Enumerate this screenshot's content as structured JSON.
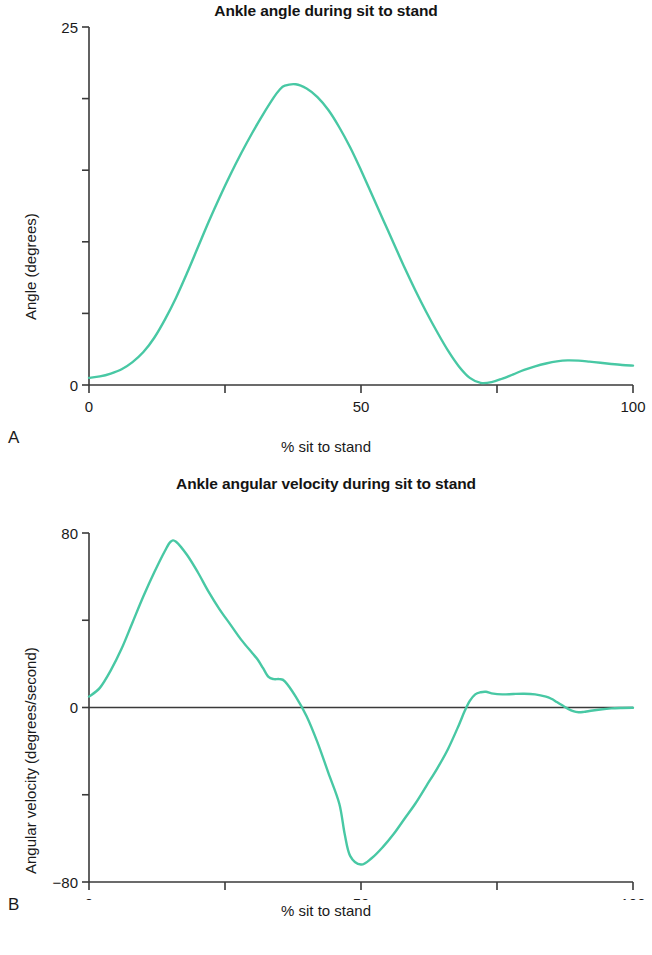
{
  "figure": {
    "background": "#ffffff",
    "line_color": "#48c8a4",
    "axis_color": "#3a3a3a",
    "text_color": "#1a1a1a"
  },
  "panels": [
    {
      "letter": "A",
      "title": "Ankle angle during sit to stand",
      "xlabel": "% sit to stand",
      "ylabel": "Angle (degrees)",
      "x_ticks": [
        0,
        25,
        50,
        75,
        100
      ],
      "x_tick_labels": [
        "0",
        "",
        "50",
        "",
        "100"
      ],
      "y_ticks": [
        0,
        5,
        10,
        15,
        20,
        25
      ],
      "y_tick_labels": [
        "0",
        "",
        "",
        "",
        "",
        "25"
      ]
    },
    {
      "letter": "B",
      "title": "Ankle angular velocity during sit to stand",
      "xlabel": "% sit to stand",
      "ylabel": "Angular velocity (degrees/second)",
      "x_ticks": [
        0,
        25,
        50,
        75,
        100
      ],
      "x_tick_labels": [
        "0",
        "",
        "50",
        "",
        "100"
      ],
      "y_ticks": [
        -80,
        -40,
        0,
        40,
        80
      ],
      "y_tick_labels": [
        "−80",
        "",
        "0",
        "",
        "80"
      ]
    }
  ],
  "chart_data": [
    {
      "type": "line",
      "title": "Ankle angle during sit to stand",
      "xlabel": "% sit to stand",
      "ylabel": "Angle (degrees)",
      "xlim": [
        0,
        100
      ],
      "ylim": [
        0,
        25
      ],
      "grid": false,
      "legend": "none",
      "series": [
        {
          "name": "Ankle angle",
          "color": "#48c8a4",
          "x": [
            0,
            2,
            4,
            6,
            8,
            10,
            12,
            14,
            16,
            18,
            20,
            22,
            24,
            26,
            28,
            30,
            32,
            34,
            35,
            36,
            38,
            40,
            42,
            44,
            46,
            48,
            50,
            52,
            54,
            56,
            58,
            60,
            62,
            64,
            66,
            68,
            70,
            72,
            74,
            76,
            78,
            80,
            82,
            84,
            86,
            88,
            90,
            92,
            94,
            96,
            98,
            100
          ],
          "y": [
            0.5,
            0.6,
            0.8,
            1.1,
            1.6,
            2.3,
            3.3,
            4.6,
            6.1,
            7.8,
            9.6,
            11.4,
            13.1,
            14.7,
            16.2,
            17.6,
            18.9,
            20.1,
            20.6,
            20.9,
            21.0,
            20.7,
            20.1,
            19.2,
            18.0,
            16.6,
            15.0,
            13.3,
            11.6,
            9.9,
            8.2,
            6.6,
            5.1,
            3.7,
            2.4,
            1.3,
            0.5,
            0.15,
            0.2,
            0.45,
            0.75,
            1.05,
            1.3,
            1.5,
            1.65,
            1.72,
            1.7,
            1.63,
            1.55,
            1.47,
            1.4,
            1.35
          ]
        }
      ]
    },
    {
      "type": "line",
      "title": "Ankle angular velocity during sit to stand",
      "xlabel": "% sit to stand",
      "ylabel": "Angular velocity (degrees/second)",
      "xlim": [
        0,
        100
      ],
      "ylim": [
        -80,
        80
      ],
      "grid": false,
      "legend": "none",
      "zero_line": true,
      "series": [
        {
          "name": "Ankle angular velocity",
          "color": "#48c8a4",
          "x": [
            0,
            2,
            4,
            6,
            8,
            10,
            12,
            14,
            15,
            16,
            18,
            20,
            22,
            24,
            26,
            28,
            30,
            31,
            32,
            33,
            34,
            35,
            36,
            38,
            40,
            42,
            44,
            46,
            47,
            48,
            50,
            52,
            54,
            56,
            58,
            60,
            62,
            64,
            66,
            68,
            69,
            70,
            71,
            72,
            73,
            74,
            76,
            78,
            80,
            82,
            84,
            85,
            86,
            87,
            88,
            89,
            90,
            91,
            92,
            94,
            96,
            98,
            100
          ],
          "y": [
            5,
            9,
            17,
            27,
            39,
            51,
            62,
            72,
            76,
            76,
            70,
            62,
            53,
            45,
            38,
            31,
            25,
            22,
            18,
            14,
            13,
            13,
            12,
            5,
            -4,
            -16,
            -30,
            -44,
            -58,
            -68,
            -72,
            -69,
            -64,
            -58,
            -51,
            -44,
            -36,
            -28,
            -19,
            -8,
            -2,
            3,
            6,
            7,
            7.2,
            6.5,
            6.0,
            6.2,
            6.3,
            6.0,
            5.0,
            4.0,
            2.5,
            1.0,
            -0.5,
            -1.7,
            -2.2,
            -2.0,
            -1.6,
            -0.9,
            -0.4,
            -0.2,
            -0.1
          ]
        }
      ]
    }
  ]
}
